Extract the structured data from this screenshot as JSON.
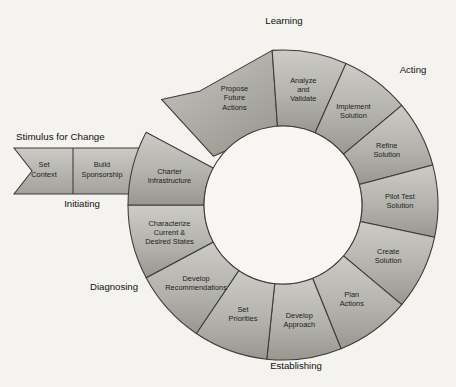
{
  "diagram": {
    "title_label": "Stimulus for Change",
    "background_color": "#f4f3ef",
    "segment_fill_light": "#c9c9c4",
    "segment_fill_dark": "#9a9a95",
    "outline_color": "#3a3a3a",
    "inner_hole_color": "#f7f6f2",
    "geometry": {
      "center_x": 283,
      "center_y": 205,
      "outer_radius": 155,
      "inner_radius": 79
    }
  },
  "phases": [
    {
      "name": "phase-learning",
      "label": "Learning",
      "x": 284,
      "y": 24
    },
    {
      "name": "phase-acting",
      "label": "Acting",
      "x": 413,
      "y": 73
    },
    {
      "name": "phase-establishing",
      "label": "Establishing",
      "x": 296,
      "y": 369
    },
    {
      "name": "phase-diagnosing",
      "label": "Diagnosing",
      "x": 114,
      "y": 290
    },
    {
      "name": "phase-initiating",
      "label": "Initiating",
      "x": 82,
      "y": 207
    }
  ],
  "entry_bar": {
    "name": "stimulus-for-change-bar",
    "title": "Stimulus for Change",
    "title_x": 16,
    "title_y": 140,
    "steps": [
      {
        "name": "step-set-context",
        "lines": [
          "Set",
          "Context"
        ],
        "x": 44,
        "y": 170
      },
      {
        "name": "step-build-sponsorship",
        "lines": [
          "Build",
          "Sponsorship"
        ],
        "x": 102,
        "y": 170
      }
    ]
  },
  "ring_segments": [
    {
      "name": "segment-propose-future-actions",
      "lines": [
        "Propose",
        "Future",
        "Actions"
      ],
      "group": "Learning",
      "arrow_head": true,
      "a0": 225.0,
      "a1": 266.0
    },
    {
      "name": "segment-analyze-and-validate",
      "lines": [
        "Analyze",
        "and",
        "Validate"
      ],
      "group": "Learning",
      "arrow_head": false,
      "a0": 266.0,
      "a1": 294.0
    },
    {
      "name": "segment-implement-solution",
      "lines": [
        "Implement",
        "Solution"
      ],
      "group": "Acting",
      "arrow_head": false,
      "a0": 294.0,
      "a1": 320.0
    },
    {
      "name": "segment-refine-solution",
      "lines": [
        "Refine",
        "Solution"
      ],
      "group": "Acting",
      "arrow_head": false,
      "a0": 320.0,
      "a1": 345.0
    },
    {
      "name": "segment-pilot-test-solution",
      "lines": [
        "Pilot Test",
        "Solution"
      ],
      "group": "Acting",
      "arrow_head": false,
      "a0": 345.0,
      "a1": 372.0
    },
    {
      "name": "segment-create-solution",
      "lines": [
        "Create",
        "Solution"
      ],
      "group": "Acting",
      "arrow_head": false,
      "a0": 372.0,
      "a1": 400.0
    },
    {
      "name": "segment-plan-actions",
      "lines": [
        "Plan",
        "Actions"
      ],
      "group": "Establishing",
      "arrow_head": false,
      "a0": 400.0,
      "a1": 428.0
    },
    {
      "name": "segment-develop-approach",
      "lines": [
        "Develop",
        "Approach"
      ],
      "group": "Establishing",
      "arrow_head": false,
      "a0": 428.0,
      "a1": 456.0
    },
    {
      "name": "segment-set-priorities",
      "lines": [
        "Set",
        "Priorities"
      ],
      "group": "Establishing",
      "arrow_head": false,
      "a0": 456.0,
      "a1": 484.0
    },
    {
      "name": "segment-develop-recommendations",
      "lines": [
        "Develop",
        "Recommendations"
      ],
      "group": "Diagnosing",
      "arrow_head": false,
      "a0": 484.0,
      "a1": 512.0
    },
    {
      "name": "segment-characterize-states",
      "lines": [
        "Characterize",
        "Current &",
        "Desired States"
      ],
      "group": "Diagnosing",
      "arrow_head": false,
      "a0": 512.0,
      "a1": 540.0
    },
    {
      "name": "segment-charter-infrastructure",
      "lines": [
        "Charter",
        "Infrastructure"
      ],
      "group": "Initiating",
      "arrow_head": false,
      "a0": 540.0,
      "a1": 568.0
    }
  ]
}
